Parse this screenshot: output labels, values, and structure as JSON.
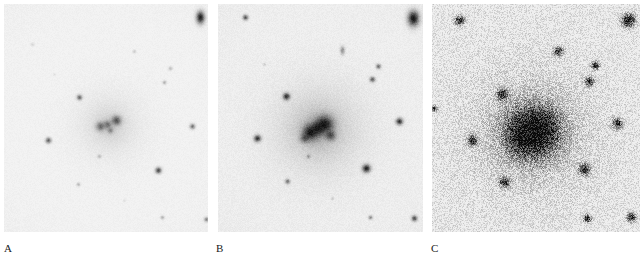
{
  "figure": {
    "kind": "astronomical-photographic-plates",
    "panel_count": 3,
    "background_color": "#ffffff"
  },
  "panels": [
    {
      "label": "A",
      "label_x": 4,
      "label_y": 243,
      "x": 4,
      "y": 4,
      "width": 204,
      "height": 228,
      "exposure": "short",
      "sky_level": "#f3f3f3",
      "grain_amount": 0.035,
      "grain_scale": 1.0,
      "vignette": 0.05,
      "core": {
        "halo_radius": 34,
        "halo_strength": 0.22,
        "lobes": [
          {
            "cx": 96,
            "cy": 122,
            "r": 5.0,
            "strength": 0.5
          },
          {
            "cx": 103,
            "cy": 120,
            "r": 4.2,
            "strength": 0.42
          },
          {
            "cx": 112,
            "cy": 116,
            "r": 5.2,
            "strength": 0.62
          },
          {
            "cx": 106,
            "cy": 126,
            "r": 3.4,
            "strength": 0.34
          }
        ],
        "cx": 105,
        "cy": 121
      },
      "stars": [
        {
          "cx": 196,
          "cy": 13,
          "r": 4.6,
          "strength": 0.88,
          "elong": 1.5
        },
        {
          "cx": 28,
          "cy": 40,
          "r": 2.0,
          "strength": 0.12
        },
        {
          "cx": 130,
          "cy": 47,
          "r": 2.0,
          "strength": 0.16
        },
        {
          "cx": 166,
          "cy": 64,
          "r": 2.2,
          "strength": 0.22
        },
        {
          "cx": 160,
          "cy": 78,
          "r": 2.2,
          "strength": 0.26
        },
        {
          "cx": 75,
          "cy": 93,
          "r": 3.0,
          "strength": 0.55
        },
        {
          "cx": 188,
          "cy": 122,
          "r": 3.0,
          "strength": 0.5
        },
        {
          "cx": 44,
          "cy": 136,
          "r": 3.2,
          "strength": 0.58
        },
        {
          "cx": 95,
          "cy": 152,
          "r": 2.2,
          "strength": 0.2
        },
        {
          "cx": 154,
          "cy": 166,
          "r": 3.4,
          "strength": 0.7
        },
        {
          "cx": 74,
          "cy": 180,
          "r": 2.2,
          "strength": 0.22
        },
        {
          "cx": 158,
          "cy": 213,
          "r": 2.2,
          "strength": 0.26
        },
        {
          "cx": 202,
          "cy": 215,
          "r": 2.6,
          "strength": 0.42
        },
        {
          "cx": 50,
          "cy": 70,
          "r": 1.6,
          "strength": 0.08
        },
        {
          "cx": 120,
          "cy": 196,
          "r": 1.6,
          "strength": 0.08
        }
      ]
    },
    {
      "label": "B",
      "label_x": 216,
      "label_y": 243,
      "x": 218,
      "y": 4,
      "width": 205,
      "height": 228,
      "exposure": "medium",
      "sky_level": "#f1f1f1",
      "grain_amount": 0.05,
      "grain_scale": 1.0,
      "vignette": 0.07,
      "core": {
        "halo_radius": 46,
        "halo_strength": 0.4,
        "lobes": [
          {
            "cx": 92,
            "cy": 128,
            "r": 8.5,
            "strength": 0.92
          },
          {
            "cx": 106,
            "cy": 120,
            "r": 9.5,
            "strength": 0.95
          },
          {
            "cx": 99,
            "cy": 124,
            "r": 6.5,
            "strength": 0.8
          },
          {
            "cx": 112,
            "cy": 131,
            "r": 5.5,
            "strength": 0.6
          },
          {
            "cx": 86,
            "cy": 134,
            "r": 4.5,
            "strength": 0.5
          }
        ],
        "cx": 100,
        "cy": 125
      },
      "stars": [
        {
          "cx": 195,
          "cy": 14,
          "r": 6.2,
          "strength": 0.95,
          "elong": 1.35
        },
        {
          "cx": 27,
          "cy": 13,
          "r": 3.0,
          "strength": 0.62
        },
        {
          "cx": 124,
          "cy": 46,
          "r": 2.6,
          "strength": 0.4,
          "elong": 1.8
        },
        {
          "cx": 160,
          "cy": 62,
          "r": 2.8,
          "strength": 0.52
        },
        {
          "cx": 154,
          "cy": 75,
          "r": 3.0,
          "strength": 0.6
        },
        {
          "cx": 68,
          "cy": 92,
          "r": 3.8,
          "strength": 0.82
        },
        {
          "cx": 181,
          "cy": 117,
          "r": 3.8,
          "strength": 0.8
        },
        {
          "cx": 39,
          "cy": 134,
          "r": 3.8,
          "strength": 0.8
        },
        {
          "cx": 90,
          "cy": 152,
          "r": 2.2,
          "strength": 0.32
        },
        {
          "cx": 148,
          "cy": 164,
          "r": 4.4,
          "strength": 0.88
        },
        {
          "cx": 69,
          "cy": 177,
          "r": 2.8,
          "strength": 0.5
        },
        {
          "cx": 152,
          "cy": 213,
          "r": 2.4,
          "strength": 0.4
        },
        {
          "cx": 196,
          "cy": 214,
          "r": 3.2,
          "strength": 0.68
        },
        {
          "cx": 46,
          "cy": 60,
          "r": 1.8,
          "strength": 0.14
        },
        {
          "cx": 114,
          "cy": 194,
          "r": 1.8,
          "strength": 0.14
        }
      ]
    },
    {
      "label": "C",
      "label_x": 431,
      "label_y": 243,
      "x": 432,
      "y": 4,
      "width": 208,
      "height": 228,
      "exposure": "deep",
      "sky_level": "#efefef",
      "grain_amount": 0.3,
      "grain_scale": 1.0,
      "vignette": 0.06,
      "core": {
        "halo_radius": 66,
        "halo_strength": 0.52,
        "lobes": [
          {
            "cx": 99,
            "cy": 128,
            "r": 27.0,
            "strength": 0.88
          },
          {
            "cx": 106,
            "cy": 124,
            "r": 20.0,
            "strength": 0.9
          },
          {
            "cx": 92,
            "cy": 133,
            "r": 17.0,
            "strength": 0.78
          }
        ],
        "cx": 100,
        "cy": 128
      },
      "stars": [
        {
          "cx": 196,
          "cy": 16,
          "r": 7.5,
          "strength": 0.95
        },
        {
          "cx": 27,
          "cy": 16,
          "r": 5.2,
          "strength": 0.88
        },
        {
          "cx": 126,
          "cy": 47,
          "r": 5.2,
          "strength": 0.88
        },
        {
          "cx": 163,
          "cy": 61,
          "r": 4.4,
          "strength": 0.82
        },
        {
          "cx": 157,
          "cy": 77,
          "r": 5.0,
          "strength": 0.88
        },
        {
          "cx": 70,
          "cy": 90,
          "r": 6.0,
          "strength": 0.9
        },
        {
          "cx": 185,
          "cy": 119,
          "r": 5.6,
          "strength": 0.9
        },
        {
          "cx": 40,
          "cy": 136,
          "r": 5.4,
          "strength": 0.9
        },
        {
          "cx": 152,
          "cy": 165,
          "r": 6.2,
          "strength": 0.92
        },
        {
          "cx": 72,
          "cy": 178,
          "r": 5.4,
          "strength": 0.9
        },
        {
          "cx": 155,
          "cy": 214,
          "r": 4.4,
          "strength": 0.85
        },
        {
          "cx": 199,
          "cy": 213,
          "r": 5.0,
          "strength": 0.88
        },
        {
          "cx": 2,
          "cy": 104,
          "r": 3.4,
          "strength": 0.7
        }
      ]
    }
  ]
}
